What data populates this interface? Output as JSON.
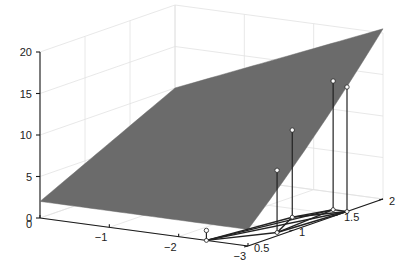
{
  "chart_data": {
    "type": "surface3d",
    "title": "",
    "xlabel": "",
    "ylabel": "",
    "zlabel": "",
    "x_axis": {
      "range": [
        -3,
        0
      ],
      "ticks": [
        0,
        -1,
        -2,
        -3
      ],
      "tick_labels": [
        "0",
        "−1",
        "−2",
        "−3"
      ]
    },
    "y_axis": {
      "range": [
        0.5,
        2
      ],
      "ticks": [
        0.5,
        1,
        1.5,
        2
      ],
      "tick_labels": [
        "0.5",
        "1",
        "1.5",
        "2"
      ]
    },
    "z_axis": {
      "range": [
        0,
        20
      ],
      "ticks": [
        0,
        5,
        10,
        15,
        20
      ],
      "tick_labels": [
        "0",
        "5",
        "10",
        "15",
        "20"
      ]
    },
    "grid": true,
    "surface": {
      "description": "smooth curved surface rising from about z=2 at x=0,y=0.5 to about z=18 at x=-3,y=2",
      "color": "#6b6b6b",
      "corner_values": [
        {
          "x": 0,
          "y": 0.5,
          "z": 2
        },
        {
          "x": -3,
          "y": 0.5,
          "z": 2
        },
        {
          "x": 0,
          "y": 2,
          "z": 10
        },
        {
          "x": -3,
          "y": 2,
          "z": 18
        }
      ]
    },
    "points": [
      {
        "x": -2.4,
        "y": 0.5,
        "z": 1.2
      },
      {
        "x": -2.9,
        "y": 0.9,
        "z": 7.5
      },
      {
        "x": -2.6,
        "y": 1.3,
        "z": 10.5
      },
      {
        "x": -2.8,
        "y": 1.6,
        "z": 15.5
      },
      {
        "x": -3.0,
        "y": 1.6,
        "z": 15.0
      }
    ],
    "projection": {
      "description": "triangle of black lines connecting projected points on the base plane (z=0)",
      "color": "#1a1a1a"
    },
    "colors": {
      "surface": "#6b6b6b",
      "axis": "#1a1a1a",
      "grid": "#e2e2e2",
      "marker": "#ffffff"
    }
  }
}
